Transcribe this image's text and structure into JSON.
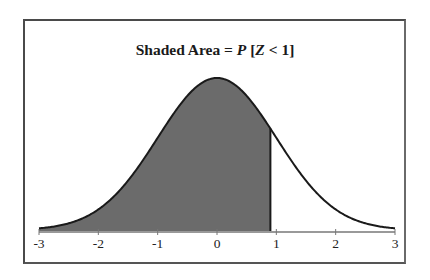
{
  "chart_data": {
    "type": "area",
    "title": "Shaded Area = P [Z < 1]",
    "title_parts": {
      "prefix": "Shaded Area = ",
      "p": "P",
      "bracket_open": " [",
      "z": "Z",
      "rest": " < 1]"
    },
    "xlabel": "",
    "ylabel": "",
    "xlim": [
      -3,
      3
    ],
    "x_ticks": [
      "-3",
      "-2",
      "-1",
      "0",
      "1",
      "2",
      "3"
    ],
    "distribution": "standard normal density",
    "shaded_region": {
      "from": -3,
      "to": 0.9
    },
    "shade_color": "#6b6b6b",
    "curve_color": "#1a1a1a",
    "grid": false,
    "legend": null
  }
}
